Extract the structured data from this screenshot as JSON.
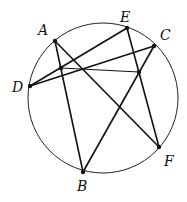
{
  "diagram": {
    "type": "geometry-circle",
    "circle": {
      "cx": 103,
      "cy": 98,
      "r": 75
    },
    "points": [
      {
        "id": "A",
        "label": "A",
        "x": 55,
        "y": 41,
        "lx": 38,
        "ly": 35
      },
      {
        "id": "E",
        "label": "E",
        "x": 127,
        "y": 28,
        "lx": 120,
        "ly": 22
      },
      {
        "id": "C",
        "label": "C",
        "x": 154,
        "y": 46,
        "lx": 160,
        "ly": 40
      },
      {
        "id": "D",
        "label": "D",
        "x": 30,
        "y": 86,
        "lx": 12,
        "ly": 92
      },
      {
        "id": "F",
        "label": "F",
        "x": 159,
        "y": 147,
        "lx": 164,
        "ly": 166
      },
      {
        "id": "B",
        "label": "B",
        "x": 83,
        "y": 172,
        "lx": 77,
        "ly": 191
      }
    ],
    "interior_points": [
      {
        "id": "P",
        "x": 61,
        "y": 68
      },
      {
        "id": "Q",
        "x": 139,
        "y": 72
      }
    ],
    "segments": [
      [
        "A",
        "B"
      ],
      [
        "A",
        "F"
      ],
      [
        "E",
        "F"
      ],
      [
        "E",
        "D"
      ],
      [
        "C",
        "D"
      ],
      [
        "C",
        "B"
      ],
      [
        "P",
        "Q"
      ]
    ],
    "labels": {
      "A": "A",
      "B": "B",
      "C": "C",
      "D": "D",
      "E": "E",
      "F": "F"
    }
  }
}
